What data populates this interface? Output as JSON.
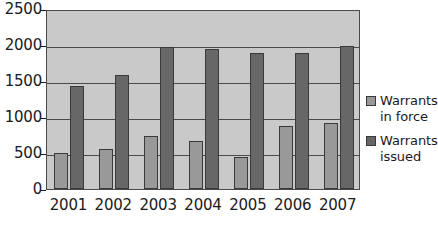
{
  "chart_data": {
    "type": "bar",
    "title": "",
    "subtitle": "",
    "xlabel": "",
    "ylabel": "",
    "categories": [
      "2001",
      "2002",
      "2003",
      "2004",
      "2005",
      "2006",
      "2007"
    ],
    "series": [
      {
        "name": "Warrants\nin force",
        "legend_label": "Warrants\nin force",
        "color": "#999999",
        "values": [
          500,
          550,
          730,
          670,
          450,
          870,
          910
        ]
      },
      {
        "name": "Warrants\nissued",
        "legend_label": "Warrants\nissued",
        "color": "#676767",
        "values": [
          1430,
          1580,
          1970,
          1940,
          1890,
          1890,
          1980
        ]
      }
    ],
    "ylim": [
      0,
      2500
    ],
    "y_ticks": [
      0,
      500,
      1000,
      1500,
      2000,
      2500
    ],
    "y_tick_labels": [
      "0",
      "500",
      "1000",
      "1500",
      "2000",
      "2500"
    ],
    "grid": true,
    "legend_position": "right",
    "plot_background_color": "#c9c9c9",
    "axis_color": "#4a4a4a",
    "text_color": "#1a1a1a"
  }
}
